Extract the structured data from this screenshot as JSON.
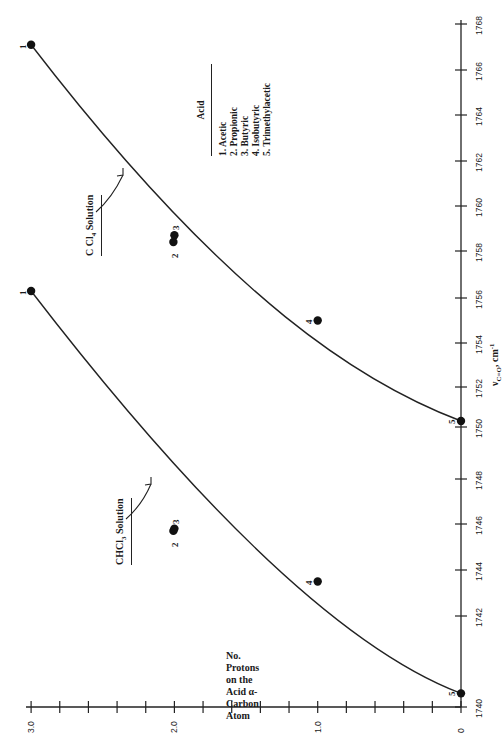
{
  "chart_data": {
    "type": "line",
    "orientation": "rotated 90° counter-clockwise (x-axis runs vertically on right side, y-axis runs horizontally along bottom)",
    "title": "",
    "xlabel": "ν C=O, cm⁻¹",
    "ylabel": "No. Protons on the Acid α-Carbon Atom",
    "xlim": [
      1740,
      1768
    ],
    "ylim": [
      0,
      3.0
    ],
    "x_ticks": [
      1740,
      1742,
      1744,
      1746,
      1748,
      1750,
      1752,
      1754,
      1756,
      1758,
      1760,
      1762,
      1764,
      1766,
      1768
    ],
    "y_ticks": [
      0,
      1.0,
      2.0,
      3.0
    ],
    "y_minor_tick_step": 0.2,
    "grid": false,
    "series": [
      {
        "name": "CCl4 Solution",
        "points": [
          {
            "label": "1",
            "acid": "Acetic",
            "x": 1767.1,
            "y": 3.0
          },
          {
            "label": "2",
            "acid": "Propionic",
            "x": 1758.4,
            "y": 2.0
          },
          {
            "label": "3",
            "acid": "Butyric",
            "x": 1758.7,
            "y": 2.0
          },
          {
            "label": "4",
            "acid": "Isobutyric",
            "x": 1755.0,
            "y": 1.0
          },
          {
            "label": "5",
            "acid": "Trimethylacetic",
            "x": 1750.3,
            "y": 0
          }
        ],
        "fitted_curve": true
      },
      {
        "name": "CHCl3 Solution",
        "points": [
          {
            "label": "1",
            "acid": "Acetic",
            "x": 1756.3,
            "y": 3.0
          },
          {
            "label": "2",
            "acid": "Propionic",
            "x": 1745.7,
            "y": 2.0
          },
          {
            "label": "3",
            "acid": "Butyric",
            "x": 1745.8,
            "y": 2.0
          },
          {
            "label": "4",
            "acid": "Isobutyric",
            "x": 1743.5,
            "y": 1.0
          },
          {
            "label": "5",
            "acid": "Trimethylacetic",
            "x": 1740.3,
            "y": 0
          }
        ],
        "fitted_curve": true
      }
    ],
    "legend": {
      "title": "Acid",
      "entries": [
        "1. Acetic",
        "2. Propionic",
        "3. Butyric",
        "4. Isobutyric",
        "5. Trimethylacetic"
      ]
    },
    "annotations": [
      "CCl4 Solution",
      "CHCl3 Solution"
    ]
  },
  "labels": {
    "ylabel_lines": [
      "No.",
      "Protons",
      "on the",
      "Acid α-",
      "Carbon",
      "Atom"
    ],
    "xlabel_main": "ν",
    "xlabel_sub": "C=O",
    "xlabel_unit": ", cm",
    "xlabel_exp": "-1",
    "ccl4_main": "C Cl",
    "ccl4_sub": "4",
    "ccl4_tail": " Solution",
    "chcl3_main": "CHCl",
    "chcl3_sub": "3",
    "chcl3_tail": " Solution",
    "legend_title": "Acid"
  }
}
